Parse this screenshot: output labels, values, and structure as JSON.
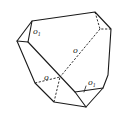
{
  "figure": {
    "type": "crystal-polyhedron-line-drawing",
    "labels": [
      {
        "id": "face-top-left",
        "text": "o",
        "sub": "1",
        "x": 33,
        "y": 34
      },
      {
        "id": "face-center",
        "text": "o",
        "sub": "",
        "x": 73,
        "y": 53
      },
      {
        "id": "face-lower-left",
        "text": "o",
        "sub": "",
        "x": 44,
        "y": 80
      },
      {
        "id": "face-lower-right",
        "text": "o",
        "sub": "1",
        "x": 88,
        "y": 85
      }
    ],
    "colors": {
      "line": "#1a1a1a",
      "background": "#ffffff"
    }
  }
}
